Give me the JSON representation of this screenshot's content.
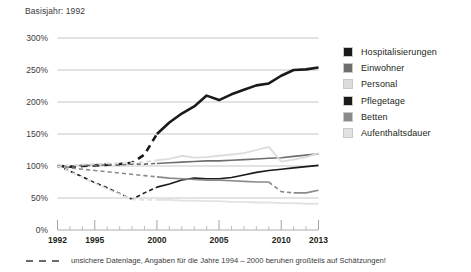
{
  "header": {
    "basisjahr_label": "Basisjahr: 1992"
  },
  "footnote": {
    "text": "unsichere Datenlage, Angaben für die Jahre 1994 – 2000 beruhen großteils auf Schätzungen!",
    "marker": "dashed-line-sample"
  },
  "legend": {
    "position": "right",
    "items": [
      {
        "label": "Hospitalisierungen",
        "color": "#1a1a1a"
      },
      {
        "label": "Einwohner",
        "color": "#6e6e6e"
      },
      {
        "label": "Personal",
        "color": "#dcdcdc"
      },
      {
        "label": "Pflegetage",
        "color": "#1a1a1a"
      },
      {
        "label": "Betten",
        "color": "#8a8a8a"
      },
      {
        "label": "Aufenthaltsdauer",
        "color": "#e2e2e2"
      }
    ]
  },
  "chart_data": {
    "type": "line",
    "title": "Basisjahr: 1992",
    "xlabel": "",
    "ylabel": "",
    "xlim": [
      1992,
      2013
    ],
    "ylim": [
      0,
      300
    ],
    "ytick_labels": [
      "0%",
      "50%",
      "100%",
      "150%",
      "200%",
      "250%",
      "300%"
    ],
    "yticks": [
      0,
      50,
      100,
      150,
      200,
      250,
      300
    ],
    "xtick_labels": [
      "1992",
      "1995",
      "2000",
      "2005",
      "2010",
      "2013"
    ],
    "xticks": [
      1992,
      1995,
      2000,
      2005,
      2010,
      2013
    ],
    "xminor_ticks": [
      1993,
      1994,
      1996,
      1997,
      1998,
      1999,
      2001,
      2002,
      2003,
      2004,
      2006,
      2007,
      2008,
      2009,
      2011,
      2012
    ],
    "grid": "horizontal",
    "units": "percent of 1992 base year",
    "dashed_range": [
      1992,
      2000
    ],
    "dashed_note": "unsichere Datenlage 1994–2000",
    "x": [
      1992,
      1993,
      1994,
      1995,
      1996,
      1997,
      1998,
      1999,
      2000,
      2001,
      2002,
      2003,
      2004,
      2005,
      2006,
      2007,
      2008,
      2009,
      2010,
      2011,
      2012,
      2013
    ],
    "series": [
      {
        "name": "Hospitalisierungen",
        "color": "#1a1a1a",
        "width": 2.6,
        "dash_until": 2000,
        "values": [
          100,
          99,
          100,
          101,
          102,
          103,
          105,
          118,
          150,
          168,
          182,
          193,
          210,
          203,
          212,
          219,
          226,
          229,
          241,
          250,
          251,
          254
        ]
      },
      {
        "name": "Einwohner",
        "color": "#6e6e6e",
        "width": 1.6,
        "dash_until": 2000,
        "values": [
          100,
          100,
          101,
          101,
          102,
          102,
          103,
          103,
          104,
          105,
          106,
          107,
          108,
          108,
          109,
          110,
          111,
          112,
          113,
          115,
          117,
          119
        ]
      },
      {
        "name": "Personal",
        "color": "#dcdcdc",
        "width": 1.8,
        "dash_until": 2000,
        "values": [
          100,
          101,
          102,
          103,
          104,
          104,
          105,
          106,
          109,
          111,
          116,
          113,
          114,
          116,
          118,
          120,
          125,
          130,
          107,
          110,
          114,
          120
        ]
      },
      {
        "name": "Pflegetage",
        "color": "#1a1a1a",
        "width": 1.6,
        "dash_until": 2000,
        "values": [
          100,
          92,
          83,
          74,
          66,
          57,
          48,
          58,
          67,
          72,
          78,
          81,
          80,
          80,
          82,
          86,
          90,
          93,
          95,
          97,
          99,
          101
        ]
      },
      {
        "name": "Betten",
        "color": "#8a8a8a",
        "width": 1.6,
        "dash_until": 2000,
        "dash_from": 2009,
        "dash_to": 2011,
        "values": [
          100,
          97,
          95,
          93,
          91,
          89,
          87,
          85,
          83,
          81,
          80,
          79,
          78,
          78,
          77,
          76,
          75,
          75,
          60,
          58,
          58,
          62
        ]
      },
      {
        "name": "Aufenthaltsdauer",
        "color": "#e2e2e2",
        "width": 1.8,
        "dash_until": 2000,
        "values": [
          100,
          91,
          82,
          73,
          64,
          56,
          48,
          47,
          47,
          47,
          46,
          46,
          45,
          45,
          44,
          44,
          43,
          43,
          42,
          42,
          41,
          41
        ]
      }
    ]
  }
}
